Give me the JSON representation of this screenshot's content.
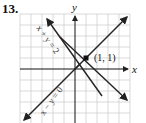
{
  "problem": {
    "number": "13."
  },
  "graph": {
    "x_axis_label": "x",
    "y_axis_label": "y",
    "grid": {
      "xmin": -5,
      "xmax": 5,
      "ymin": -5,
      "ymax": 5
    },
    "lines": [
      {
        "equation": "x + y = 2",
        "label": "x + y = 2"
      },
      {
        "equation": "x − y = 0",
        "label": "x − y = 0"
      }
    ],
    "intersection": {
      "x": 1,
      "y": 1,
      "label": "(1, 1)"
    },
    "colors": {
      "grid": "#c8c8c8",
      "axes": "#111111",
      "lines": "#222222"
    }
  }
}
